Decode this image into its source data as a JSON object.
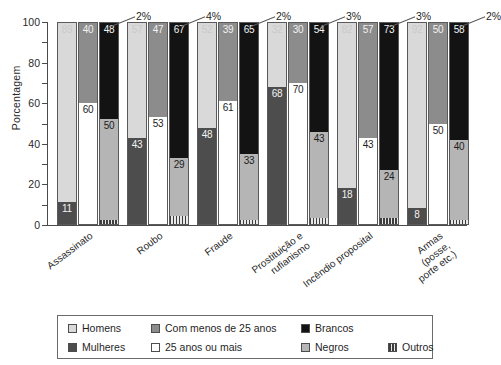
{
  "chart_data": {
    "type": "bar",
    "subtype": "grouped-stacked-100",
    "title": "",
    "xlabel": "",
    "ylabel": "Porcentagem",
    "ylim": [
      0,
      100
    ],
    "ytick_labels": [
      "0",
      "20",
      "40",
      "60",
      "80",
      "100"
    ],
    "ytick_values": [
      0,
      20,
      40,
      60,
      80,
      100
    ],
    "minor_tick_step": 10,
    "grid": false,
    "legend_position": "bottom",
    "categories": [
      "Assassinato",
      "Roubo",
      "Fraude",
      "Prostituição e\nrufianismo",
      "Incêndio proposital",
      "Armas\n(posse,\nporte etc.)"
    ],
    "legend_entries": [
      {
        "key": "homens",
        "label": "Homens",
        "color": "#d9d9d9",
        "pattern": "solid"
      },
      {
        "key": "mulheres",
        "label": "Mulheres",
        "color": "#4d4d4d",
        "pattern": "solid"
      },
      {
        "key": "under25",
        "label": "Com menos de 25 anos",
        "color": "#8c8c8c",
        "pattern": "solid"
      },
      {
        "key": "over25",
        "label": "25 anos ou mais",
        "color": "#ffffff",
        "pattern": "solid"
      },
      {
        "key": "brancos",
        "label": "Brancos",
        "color": "#131313",
        "pattern": "solid"
      },
      {
        "key": "negros",
        "label": "Negros",
        "color": "#b5b5b5",
        "pattern": "solid"
      },
      {
        "key": "outros",
        "label": "Outros",
        "color": "#3d3d3d",
        "pattern": "vertical-stripes"
      }
    ],
    "series": [
      {
        "name": "Homens",
        "values": [
          89,
          57,
          52,
          32,
          82,
          92
        ]
      },
      {
        "name": "Mulheres",
        "values": [
          11,
          43,
          48,
          68,
          18,
          8
        ]
      },
      {
        "name": "Com menos de 25 anos",
        "values": [
          40,
          47,
          39,
          30,
          57,
          50
        ]
      },
      {
        "name": "25 anos ou mais",
        "values": [
          60,
          53,
          61,
          70,
          43,
          50
        ]
      },
      {
        "name": "Brancos",
        "values": [
          48,
          67,
          65,
          54,
          73,
          58
        ]
      },
      {
        "name": "Negros",
        "values": [
          50,
          29,
          33,
          43,
          24,
          40
        ]
      },
      {
        "name": "Outros",
        "values": [
          2,
          4,
          2,
          3,
          3,
          2
        ]
      }
    ],
    "outros_annotations": [
      "2%",
      "4%",
      "2%",
      "3%",
      "3%",
      "2%"
    ],
    "groups": [
      {
        "category": "Assassinato",
        "bars": [
          {
            "name": "sexo",
            "segments": [
              {
                "key": "homens",
                "label": "89",
                "value": 89
              },
              {
                "key": "mulheres",
                "label": "11",
                "value": 11
              }
            ]
          },
          {
            "name": "idade",
            "segments": [
              {
                "key": "under25",
                "label": "40",
                "value": 40
              },
              {
                "key": "over25",
                "label": "60",
                "value": 60
              }
            ]
          },
          {
            "name": "raca",
            "segments": [
              {
                "key": "brancos",
                "label": "48",
                "value": 48
              },
              {
                "key": "negros",
                "label": "50",
                "value": 50
              },
              {
                "key": "outros",
                "label": "",
                "value": 2
              }
            ]
          }
        ],
        "outros_label": "2%"
      },
      {
        "category": "Roubo",
        "bars": [
          {
            "name": "sexo",
            "segments": [
              {
                "key": "homens",
                "label": "57",
                "value": 57
              },
              {
                "key": "mulheres",
                "label": "43",
                "value": 43
              }
            ]
          },
          {
            "name": "idade",
            "segments": [
              {
                "key": "under25",
                "label": "47",
                "value": 47
              },
              {
                "key": "over25",
                "label": "53",
                "value": 53
              }
            ]
          },
          {
            "name": "raca",
            "segments": [
              {
                "key": "brancos",
                "label": "67",
                "value": 67
              },
              {
                "key": "negros",
                "label": "29",
                "value": 29
              },
              {
                "key": "outros",
                "label": "",
                "value": 4
              }
            ]
          }
        ],
        "outros_label": "4%"
      },
      {
        "category": "Fraude",
        "bars": [
          {
            "name": "sexo",
            "segments": [
              {
                "key": "homens",
                "label": "52",
                "value": 52
              },
              {
                "key": "mulheres",
                "label": "48",
                "value": 48
              }
            ]
          },
          {
            "name": "idade",
            "segments": [
              {
                "key": "under25",
                "label": "39",
                "value": 39
              },
              {
                "key": "over25",
                "label": "61",
                "value": 61
              }
            ]
          },
          {
            "name": "raca",
            "segments": [
              {
                "key": "brancos",
                "label": "65",
                "value": 65
              },
              {
                "key": "negros",
                "label": "33",
                "value": 33
              },
              {
                "key": "outros",
                "label": "",
                "value": 2
              }
            ]
          }
        ],
        "outros_label": "2%"
      },
      {
        "category": "Prostituição e rufianismo",
        "bars": [
          {
            "name": "sexo",
            "segments": [
              {
                "key": "homens",
                "label": "32",
                "value": 32
              },
              {
                "key": "mulheres",
                "label": "68",
                "value": 68
              }
            ]
          },
          {
            "name": "idade",
            "segments": [
              {
                "key": "under25",
                "label": "30",
                "value": 30
              },
              {
                "key": "over25",
                "label": "70",
                "value": 70
              }
            ]
          },
          {
            "name": "raca",
            "segments": [
              {
                "key": "brancos",
                "label": "54",
                "value": 54
              },
              {
                "key": "negros",
                "label": "43",
                "value": 43
              },
              {
                "key": "outros",
                "label": "",
                "value": 3
              }
            ]
          }
        ],
        "outros_label": "3%"
      },
      {
        "category": "Incêndio proposital",
        "bars": [
          {
            "name": "sexo",
            "segments": [
              {
                "key": "homens",
                "label": "82",
                "value": 82
              },
              {
                "key": "mulheres",
                "label": "18",
                "value": 18
              }
            ]
          },
          {
            "name": "idade",
            "segments": [
              {
                "key": "under25",
                "label": "57",
                "value": 57
              },
              {
                "key": "over25",
                "label": "43",
                "value": 43
              }
            ]
          },
          {
            "name": "raca",
            "segments": [
              {
                "key": "brancos",
                "label": "73",
                "value": 73
              },
              {
                "key": "negros",
                "label": "24",
                "value": 24
              },
              {
                "key": "outros",
                "label": "",
                "value": 3
              }
            ]
          }
        ],
        "outros_label": "3%"
      },
      {
        "category": "Armas (posse, porte etc.)",
        "bars": [
          {
            "name": "sexo",
            "segments": [
              {
                "key": "homens",
                "label": "92",
                "value": 92
              },
              {
                "key": "mulheres",
                "label": "8",
                "value": 8
              }
            ]
          },
          {
            "name": "idade",
            "segments": [
              {
                "key": "under25",
                "label": "50",
                "value": 50
              },
              {
                "key": "over25",
                "label": "50",
                "value": 50
              }
            ]
          },
          {
            "name": "raca",
            "segments": [
              {
                "key": "brancos",
                "label": "58",
                "value": 58
              },
              {
                "key": "negros",
                "label": "40",
                "value": 40
              },
              {
                "key": "outros",
                "label": "",
                "value": 2
              }
            ]
          }
        ],
        "outros_label": "2%"
      }
    ]
  },
  "axis": {
    "ylabel": "Porcentagem",
    "yticks": [
      "100",
      "80",
      "60",
      "40",
      "20",
      "0"
    ]
  },
  "categories_display": [
    "Assassinato",
    "Roubo",
    "Fraude",
    "Prostituição e\nrufianismo",
    "Incêndio proposital",
    "Armas\n(posse,\nporte etc.)"
  ],
  "legend": {
    "col1": [
      {
        "label": "Homens",
        "key": "homens"
      },
      {
        "label": "Mulheres",
        "key": "mulheres"
      }
    ],
    "col2": [
      {
        "label": "Com menos de 25 anos",
        "key": "under25"
      },
      {
        "label": "25 anos ou mais",
        "key": "over25"
      }
    ],
    "col3": [
      {
        "label": "Brancos",
        "key": "brancos"
      },
      {
        "label": "Negros",
        "key": "negros"
      }
    ],
    "col4": [
      {
        "label": "Outros",
        "key": "outros"
      }
    ]
  }
}
